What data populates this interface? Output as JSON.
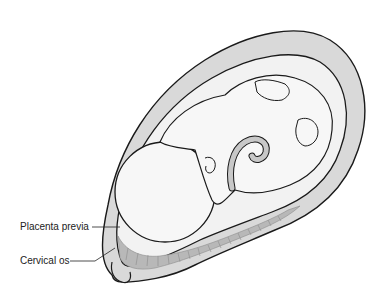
{
  "figure": {
    "labels": [
      {
        "id": "placenta-previa",
        "text": "Placenta previa"
      },
      {
        "id": "cervical-os",
        "text": "Cervical os"
      }
    ],
    "colors": {
      "outline": "#1a1a1a",
      "uterine_wall": "#d9d9d9",
      "amniotic_space": "#f2f2f2",
      "fetus_fill": "#f7f7f7",
      "placenta": "#b8b8b8",
      "placenta_lines": "#8c8c8c",
      "cord": "#c8c8c8"
    }
  }
}
